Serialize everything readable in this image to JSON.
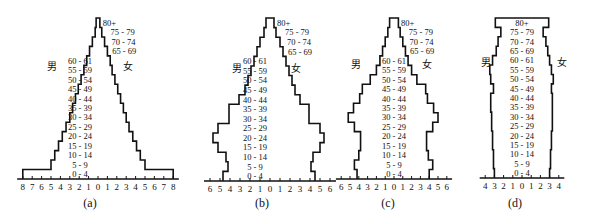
{
  "chart_data": [
    {
      "id": "a",
      "type": "bar",
      "subtype": "population-pyramid",
      "caption": "(a)",
      "left_label": "男",
      "right_label": "女",
      "categories": [
        "0 - 4",
        "5 - 9",
        "10 - 14",
        "15 - 19",
        "20 - 24",
        "25 - 29",
        "30 - 34",
        "35 - 39",
        "40 - 44",
        "45 - 49",
        "50 - 54",
        "55 - 59",
        "60 - 61",
        "65 - 69",
        "70 - 74",
        "75 - 79",
        "80+"
      ],
      "series": [
        {
          "name": "男",
          "values": [
            8.0,
            5.0,
            4.6,
            4.2,
            3.8,
            3.4,
            3.0,
            2.7,
            2.4,
            2.1,
            1.8,
            1.5,
            1.2,
            0.9,
            0.6,
            0.3,
            0.2
          ]
        },
        {
          "name": "女",
          "values": [
            8.0,
            5.0,
            4.5,
            4.1,
            3.7,
            3.3,
            3.0,
            2.7,
            2.4,
            2.1,
            1.8,
            1.5,
            1.3,
            1.0,
            0.7,
            0.4,
            0.2
          ]
        }
      ],
      "xlabel": "",
      "ylabel": "",
      "xticks_left": [
        "8",
        "7",
        "6",
        "5",
        "4",
        "3",
        "2",
        "1"
      ],
      "xticks_center": "0",
      "xticks_right": [
        "1",
        "2",
        "3",
        "4",
        "5",
        "6",
        "7",
        "8"
      ],
      "xlim": [
        -8,
        8
      ]
    },
    {
      "id": "b",
      "type": "bar",
      "subtype": "population-pyramid",
      "caption": "(b)",
      "left_label": "男",
      "right_label": "女",
      "categories": [
        "0 - 4",
        "5 - 9",
        "10 - 14",
        "15 - 19",
        "20 - 24",
        "25 - 29",
        "30 - 34",
        "35 - 39",
        "40 - 44",
        "45 - 49",
        "50 - 54",
        "55 - 59",
        "60 - 61",
        "65 - 69",
        "70 - 74",
        "75 - 79",
        "80+"
      ],
      "series": [
        {
          "name": "男",
          "values": [
            4.7,
            4.2,
            4.4,
            5.2,
            5.7,
            5.2,
            4.1,
            4.1,
            3.1,
            2.5,
            2.2,
            1.9,
            1.6,
            1.3,
            1.0,
            0.6,
            0.4
          ]
        },
        {
          "name": "女",
          "values": [
            4.5,
            4.1,
            4.3,
            5.0,
            5.4,
            5.0,
            3.9,
            3.9,
            3.0,
            2.5,
            2.2,
            1.9,
            1.6,
            1.3,
            1.0,
            0.6,
            0.4
          ]
        }
      ],
      "xlabel": "",
      "ylabel": "",
      "xticks_left": [
        "6",
        "5",
        "4",
        "3",
        "2",
        "1"
      ],
      "xticks_center": "0",
      "xticks_right": [
        "1",
        "2",
        "3",
        "4",
        "5",
        "6"
      ],
      "xlim": [
        -6,
        6
      ]
    },
    {
      "id": "c",
      "type": "bar",
      "subtype": "population-pyramid",
      "caption": "(c)",
      "left_label": "男",
      "right_label": "女",
      "categories": [
        "0 - 4",
        "5 - 9",
        "10 - 14",
        "15 - 19",
        "20 - 24",
        "25 - 29",
        "30 - 34",
        "35 - 39",
        "40 - 44",
        "45 - 49",
        "50 - 54",
        "55 - 59",
        "60 - 61",
        "65 - 69",
        "70 - 74",
        "75 - 79",
        "80+"
      ],
      "series": [
        {
          "name": "男",
          "values": [
            4.2,
            4.5,
            4.0,
            3.8,
            3.8,
            4.5,
            5.2,
            4.6,
            3.9,
            3.6,
            2.7,
            2.0,
            1.6,
            1.3,
            1.0,
            0.7,
            0.5
          ]
        },
        {
          "name": "女",
          "values": [
            4.0,
            4.4,
            3.9,
            3.7,
            3.7,
            4.4,
            5.0,
            4.5,
            3.8,
            3.6,
            2.6,
            2.0,
            1.6,
            1.3,
            1.0,
            0.7,
            0.5
          ]
        }
      ],
      "xlabel": "",
      "ylabel": "",
      "xticks_left": [
        "6",
        "5",
        "4",
        "3",
        "2",
        "1"
      ],
      "xticks_center": "0",
      "xticks_right": [
        "1",
        "2",
        "3",
        "4",
        "5",
        "6"
      ],
      "xlim": [
        -6,
        6
      ]
    },
    {
      "id": "d",
      "type": "bar",
      "subtype": "population-pyramid",
      "caption": "(d)",
      "left_label": "男",
      "right_label": "女",
      "categories": [
        "0 - 4",
        "5 - 9",
        "10 - 14",
        "15 - 19",
        "20 - 24",
        "25 - 29",
        "30 - 34",
        "35 - 39",
        "40 - 44",
        "45 - 49",
        "50 - 54",
        "55 - 59",
        "60 - 61",
        "65 - 69",
        "70 - 74",
        "75 - 79",
        "80+"
      ],
      "series": [
        {
          "name": "男",
          "values": [
            3.0,
            3.1,
            3.1,
            3.2,
            3.2,
            3.3,
            3.3,
            3.4,
            3.4,
            3.1,
            3.4,
            3.5,
            3.2,
            2.8,
            2.6,
            2.3,
            2.9
          ]
        },
        {
          "name": "女",
          "values": [
            3.0,
            3.1,
            3.1,
            3.2,
            3.2,
            3.3,
            3.3,
            3.3,
            3.3,
            3.2,
            3.4,
            3.2,
            3.0,
            2.8,
            2.6,
            2.3,
            2.9
          ]
        }
      ],
      "xlabel": "",
      "ylabel": "",
      "xticks_left": [
        "4",
        "3",
        "2",
        "1"
      ],
      "xticks_center": "0",
      "xticks_right": [
        "1",
        "2",
        "3",
        "4"
      ],
      "xlim": [
        -4,
        4
      ]
    }
  ],
  "layout": {
    "charts": [
      {
        "left": 8,
        "center": 98,
        "scale": 9.4,
        "axisY": 179,
        "labelX": 80,
        "maleX": 52,
        "femaleX": 128,
        "sexY": 70,
        "capX": 90,
        "capY": 207
      },
      {
        "left": 195,
        "center": 270,
        "scale": 10.0,
        "axisY": 181,
        "labelX": 255,
        "maleX": 237,
        "femaleX": 296,
        "sexY": 72,
        "capX": 262,
        "capY": 207
      },
      {
        "left": 345,
        "center": 394,
        "scale": 8.8,
        "axisY": 179,
        "labelX": 394,
        "maleX": 356,
        "femaleX": 427,
        "sexY": 68,
        "capX": 388,
        "capY": 207
      },
      {
        "left": 470,
        "center": 522,
        "scale": 9.2,
        "axisY": 178,
        "labelX": 522,
        "maleX": 486,
        "femaleX": 562,
        "sexY": 66,
        "capX": 515,
        "capY": 207
      }
    ],
    "topY": 18,
    "barH": 9.3
  }
}
